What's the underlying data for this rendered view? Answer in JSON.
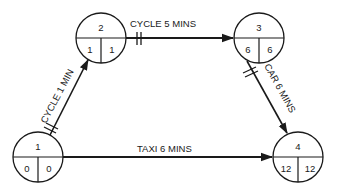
{
  "diagram": {
    "type": "network-activity-diagram",
    "colors": {
      "line": "#1a1a1a",
      "background": "#ffffff"
    },
    "nodes": [
      {
        "id": "1",
        "label": "1",
        "earliest": "0",
        "latest": "0",
        "cx": 38,
        "cy": 157
      },
      {
        "id": "2",
        "label": "2",
        "earliest": "1",
        "latest": "1",
        "cx": 101,
        "cy": 38
      },
      {
        "id": "3",
        "label": "3",
        "earliest": "6",
        "latest": "6",
        "cx": 259,
        "cy": 38
      },
      {
        "id": "4",
        "label": "4",
        "earliest": "12",
        "latest": "12",
        "cx": 298,
        "cy": 157
      }
    ],
    "edges": [
      {
        "from": "1",
        "to": "2",
        "label": "CYCLE 1 MIN",
        "critical": true
      },
      {
        "from": "2",
        "to": "3",
        "label": "CYCLE 5 MINS",
        "critical": true
      },
      {
        "from": "3",
        "to": "4",
        "label": "CAR 6 MINS",
        "critical": true
      },
      {
        "from": "1",
        "to": "4",
        "label": "TAXI 6 MINS",
        "critical": false
      }
    ]
  }
}
